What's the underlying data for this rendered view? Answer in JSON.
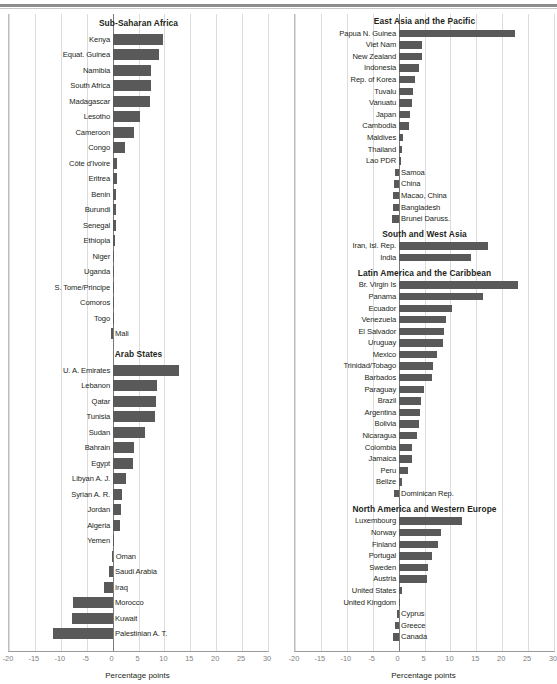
{
  "figure": {
    "axis_title": "Percentage points",
    "bar_color": "#595959",
    "grid_color": "#dcdcdc",
    "zero_line_color": "#7a7a7a"
  },
  "chart_data": {
    "type": "bar",
    "orientation": "horizontal",
    "title": "",
    "xlabel": "Percentage points",
    "ylabel": "",
    "xlim": [
      -20,
      30
    ],
    "xticks": [
      -20,
      -15,
      -10,
      -5,
      0,
      5,
      10,
      15,
      20,
      25,
      30
    ],
    "xtick_labels": [
      "-20",
      "-15",
      "-10",
      "-5",
      "0",
      "5",
      "10",
      "15",
      "20",
      "25",
      "30"
    ],
    "grid": true,
    "legend": null,
    "panels": [
      {
        "name": "left-panel",
        "groups": [
          {
            "title": "Sub-Saharan Africa",
            "categories": [
              "Kenya",
              "Equat. Guinea",
              "Namibia",
              "South Africa",
              "Madagascar",
              "Lesotho",
              "Cameroon",
              "Congo",
              "Côte d'Ivoire",
              "Eritrea",
              "Benin",
              "Burundi",
              "Senegal",
              "Ethiopia",
              "Niger",
              "Uganda",
              "S. Tome/Principe",
              "Comoros",
              "Togo",
              "Mali"
            ],
            "values": [
              9.8,
              8.9,
              7.5,
              7.4,
              7.2,
              5.3,
              4.2,
              2.3,
              0.9,
              0.8,
              0.7,
              0.7,
              0.7,
              0.5,
              0.3,
              0.3,
              0.3,
              0.2,
              0.1,
              -0.4
            ]
          },
          {
            "title": "Arab States",
            "categories": [
              "U. A. Emirates",
              "Lebanon",
              "Qatar",
              "Tunisia",
              "Sudan",
              "Bahrain",
              "Egypt",
              "Libyan A. J.",
              "Syrian A. R.",
              "Jordan",
              "Algeria",
              "Yemen",
              "Oman",
              "Saudi Arabia",
              "Iraq",
              "Morocco",
              "Kuwait",
              "Palestinian A. T."
            ],
            "values": [
              12.9,
              8.6,
              8.3,
              8.2,
              6.2,
              4.1,
              3.9,
              2.6,
              1.8,
              1.7,
              1.4,
              0.2,
              -0.2,
              -0.6,
              -1.6,
              -7.6,
              -7.9,
              -11.5
            ]
          }
        ]
      },
      {
        "name": "right-panel",
        "groups": [
          {
            "title": "East Asia and the Pacific",
            "categories": [
              "Papua N. Guinea",
              "Viet Nam",
              "New Zealand",
              "Indonesia",
              "Rep. of Korea",
              "Tuvalu",
              "Vanuatu",
              "Japan",
              "Cambodia",
              "Maldives",
              "Thailand",
              "Lao PDR",
              "Samoa",
              "China",
              "Macao, China",
              "Bangladesh",
              "Brunei Daruss."
            ],
            "values": [
              22.5,
              4.6,
              4.5,
              4.0,
              3.2,
              2.8,
              2.6,
              2.2,
              2.1,
              0.8,
              0.7,
              0.5,
              -0.7,
              -0.9,
              -1.0,
              -1.1,
              -1.3
            ]
          },
          {
            "title": "South and West Asia",
            "categories": [
              "Iran, Isl. Rep.",
              "India"
            ],
            "values": [
              17.3,
              14.0
            ]
          },
          {
            "title": "Latin America and the Caribbean",
            "categories": [
              "Br. Virgin Is",
              "Panama",
              "Ecuador",
              "Venezuela",
              "El Salvador",
              "Uruguay",
              "Mexico",
              "Trinidad/Tobago",
              "Barbados",
              "Paraguay",
              "Brazil",
              "Argentina",
              "Bolivia",
              "Nicaragua",
              "Colombia",
              "Jamaica",
              "Peru",
              "Belize",
              "Dominican Rep."
            ],
            "values": [
              23.0,
              16.2,
              10.4,
              9.2,
              8.8,
              8.6,
              7.4,
              6.6,
              6.4,
              5.0,
              4.3,
              4.1,
              3.9,
              3.5,
              2.6,
              2.5,
              1.8,
              0.7,
              -0.8
            ]
          },
          {
            "title": "North America and Western Europe",
            "categories": [
              "Luxembourg",
              "Norway",
              "Finland",
              "Portugal",
              "Sweden",
              "Austria",
              "United States",
              "United Kingdom",
              "Cyprus",
              "Greece",
              "Canada"
            ],
            "values": [
              12.2,
              8.1,
              7.6,
              6.5,
              5.6,
              5.5,
              0.6,
              0.2,
              -0.4,
              -0.7,
              -1.1
            ]
          }
        ]
      }
    ]
  }
}
